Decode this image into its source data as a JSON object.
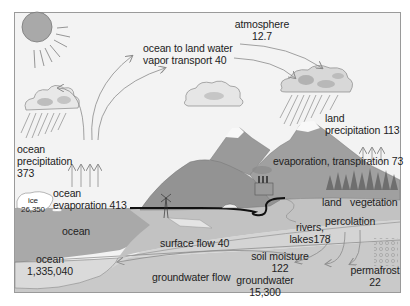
{
  "diagram": {
    "colors": {
      "background": "#f4f4f4",
      "border": "#9a9a9a",
      "sky": "#f3f3f3",
      "sun": "#a9a9a9",
      "ocean": "#a8a8a8",
      "ocean_deep": "#c8c8c8",
      "land": "#b4b4b4",
      "mountain": "#8e8e8e",
      "ground": "#c6c6c6",
      "groundwater": "#d2d2d2",
      "arrow": "#8a8a8a",
      "road": "#111111",
      "text": "#222222"
    },
    "labels": {
      "atmosphere": {
        "name": "atmosphere",
        "value": "12.7"
      },
      "ocean_to_land": {
        "line1": "ocean to land water",
        "line2": "vapor transport 40"
      },
      "ocean_precip": {
        "line1": "ocean",
        "line2": "precipitation",
        "value": "373"
      },
      "land_precip": {
        "line1": "land",
        "line2": "precipitation 113"
      },
      "evapotranspiration": {
        "text": "evaporation, transpiration 73"
      },
      "ocean_evap": {
        "line1": "ocean",
        "line2": "evaporation 413"
      },
      "ice": {
        "name": "ice",
        "value": "26,350"
      },
      "ocean_surface": {
        "text": "ocean"
      },
      "land": {
        "text": "land"
      },
      "vegetation": {
        "text": "vegetation"
      },
      "percolation": {
        "text": "percolation"
      },
      "rivers": {
        "line1": "rivers,",
        "line2": "lakes178"
      },
      "surface_flow": {
        "text": "surface flow 40"
      },
      "soil_moisture": {
        "name": "soil moisture",
        "value": "122"
      },
      "ocean_store": {
        "name": "ocean",
        "value": "1,335,040"
      },
      "groundwater_flow": {
        "text": "groundwater flow"
      },
      "groundwater": {
        "name": "groundwater",
        "value": "15,300"
      },
      "permafrost": {
        "name": "permafrost",
        "value": "22"
      }
    }
  }
}
